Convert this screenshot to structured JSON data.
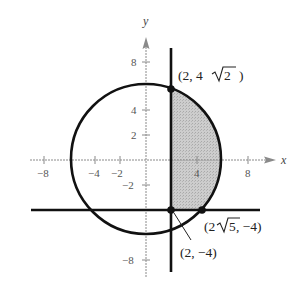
{
  "figure": {
    "axes": {
      "x_label": "x",
      "y_label": "y",
      "x_ticks": [
        {
          "value": -8,
          "label": "−8"
        },
        {
          "value": -4,
          "label": "−4"
        },
        {
          "value": -2,
          "label": "−2"
        },
        {
          "value": 4,
          "label": "4"
        },
        {
          "value": 8,
          "label": "8"
        }
      ],
      "y_ticks": [
        {
          "value": 8,
          "label": "8"
        },
        {
          "value": 4,
          "label": "4"
        },
        {
          "value": 2,
          "label": "2"
        },
        {
          "value": -2,
          "label": "−2"
        },
        {
          "value": -8,
          "label": "−8"
        }
      ]
    },
    "curves": {
      "circle": "x² + y² = 36 (center (0,0), radius 6)",
      "vertical_line": "x = 2",
      "horizontal_line": "y = −4"
    },
    "shaded_region": "bounded by x = 2, y = −4 and the circle",
    "points": [
      {
        "name": "top-intersection",
        "label_main": "(2, 4",
        "label_rad": "2",
        "label_end": ")",
        "x": 2,
        "y": 5.657
      },
      {
        "name": "corner-intersection",
        "label": "(2, −4)",
        "x": 2,
        "y": -4
      },
      {
        "name": "right-intersection",
        "label_main": "(2",
        "label_rad": "5",
        "label_end": ", −4)",
        "x": 4.472,
        "y": -4
      }
    ],
    "colors": {
      "stroke": "#111111",
      "axis": "#8a8a8a",
      "shade": "#c9c9c9"
    }
  }
}
